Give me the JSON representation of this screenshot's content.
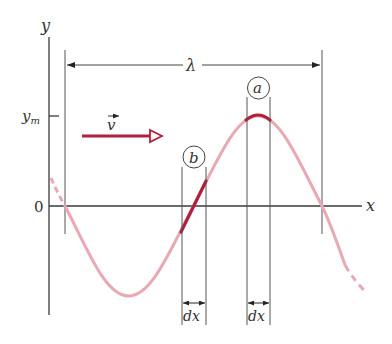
{
  "figure": {
    "type": "sinusoidal-wave-diagram",
    "axes": {
      "y_label": "y",
      "x_label": "x",
      "origin_label": "0",
      "ym_label": "y",
      "ym_subscript": "m"
    },
    "wavelength": {
      "label": "λ"
    },
    "velocity": {
      "label": "v",
      "has_vector_arrow": true
    },
    "markers": [
      {
        "id": "a",
        "label": "a",
        "element_label": "dx",
        "position": "crest"
      },
      {
        "id": "b",
        "label": "b",
        "element_label": "dx",
        "position": "zero-crossing"
      }
    ],
    "colors": {
      "axis": "#3a3a3a",
      "wave": "#e8a9b4",
      "highlight": "#b21f3b",
      "velocity_arrow": "#b21f3b"
    }
  }
}
